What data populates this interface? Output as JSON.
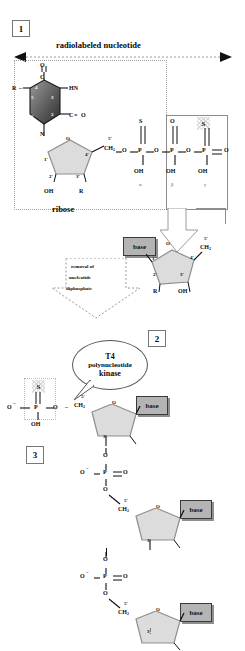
{
  "figure": {
    "colors": {
      "base_box_fill": "#b4b4b4",
      "base_box_border": "#3a3a3a",
      "ring_dark": "#6b6b6b",
      "ring_light": "#d9d9d9",
      "line": "#111111",
      "dotted": "#9a9a9a"
    }
  },
  "panels": {
    "one": {
      "number": "1",
      "header": "radiolabeled nucleotide",
      "sugar_label": "ribose"
    },
    "two": {
      "number": "2",
      "enzyme_line1": "T4",
      "enzyme_line2": "polynucleotide",
      "enzyme_line3": "kinase"
    },
    "three": {
      "number": "3"
    }
  },
  "arrow_reaction": {
    "line1": "removal of",
    "line2": "nucleotide",
    "line3": "diphosphate"
  },
  "nucleotide": {
    "base_ring": {
      "top_atom": "O",
      "c_atom": "C",
      "n3_label": "HN",
      "c2_label": "C",
      "c2_o": "O",
      "n1_label": "N",
      "r_substituent": "R",
      "positions": [
        "5",
        "4",
        "3",
        "6",
        "2",
        "1"
      ]
    },
    "ribose": {
      "ring_oxygen": "O",
      "c1": "1'",
      "c2": "2'",
      "c3": "3'",
      "c4": "4'",
      "c5": "5'",
      "c2_oh": "OH",
      "c3_r": "R",
      "c5_group": "CH"
    },
    "phosphates": {
      "alpha": {
        "greek": "α",
        "top": "S",
        "bottom": "OH",
        "atom": "P"
      },
      "beta": {
        "greek": "β",
        "top": "O",
        "bottom": "OH",
        "atom": "P"
      },
      "gamma": {
        "greek": "γ",
        "top": "S",
        "bottom": "OH",
        "atom": "P",
        "terminal_o": "O"
      },
      "bridge_o": "O"
    }
  },
  "products": {
    "diphosphate_sugar": {
      "base_label": "base",
      "ring_oxygen": "O",
      "c1": "1'",
      "c2": "2'",
      "c3": "3'",
      "c4": "4'",
      "c5": "5'",
      "c5_group": "CH",
      "c2_r": "R",
      "c3_oh": "OH"
    }
  },
  "labeled_chain": {
    "terminal_phosphate": {
      "left_o": "O",
      "atom": "P",
      "sulfur": "S",
      "hydroxyl": "OH",
      "bridge_o": "O"
    },
    "residues": [
      {
        "base_label": "base",
        "c5": "5'",
        "c5_group": "CH",
        "ring_oxygen": "O",
        "c3": "3'"
      },
      {
        "base_label": "base",
        "c5": "5'",
        "c5_group": "CH",
        "ring_oxygen": "O",
        "c3": "3'"
      },
      {
        "base_label": "base",
        "c5": "5'",
        "c5_group": "CH",
        "ring_oxygen": "O",
        "c3": "3'"
      }
    ],
    "internal_phosphates": [
      {
        "left_o": "O",
        "atom": "P",
        "right_o": "O",
        "up_o": "O",
        "down_o": "O"
      },
      {
        "left_o": "O",
        "atom": "P",
        "right_o": "O",
        "up_o": "O",
        "down_o": "O"
      }
    ]
  },
  "subscripts": {
    "two": "2"
  },
  "charges": {
    "minus": "−"
  }
}
